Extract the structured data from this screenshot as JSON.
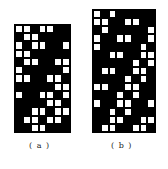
{
  "figure": {
    "panels": [
      {
        "id": "a",
        "label": "( a )",
        "cols": 7,
        "rows": [
          "WWBWWBB",
          "BWWBBBB",
          "WBWWBBW",
          "WWBBBBB",
          "BWWBBWW",
          "WBBBBBW",
          "WWBBWWB",
          "BBBBBWW",
          "WBBWWBW",
          "BBBBWWB",
          "BBWWBWW",
          "BWWBWWB",
          "BBWWBBB"
        ]
      },
      {
        "id": "b",
        "label": "( b )",
        "cols": 8,
        "rows": [
          "WBWBBBBB",
          "WWBBWWBB",
          "BWBBBBBW",
          "WBBWWBBW",
          "WBBBBBWB",
          "BBWWBBWW",
          "BBBBBWBW",
          "BWWBBWWB",
          "BBBBWBWB",
          "WWBBWWBB",
          "BBBWBWBB",
          "WBBWWBBW",
          "BBWBWBBB",
          "BBWWBBWW",
          "BWWBBWWB"
        ]
      }
    ],
    "colors": {
      "filled": "#000000",
      "empty": "#ffffff"
    }
  }
}
